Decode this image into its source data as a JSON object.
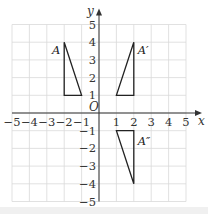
{
  "diagram": {
    "type": "coordinate-grid",
    "x_axis": {
      "label": "x",
      "min": -5,
      "max": 5,
      "ticks": [
        "−5",
        "−4",
        "−3",
        "−2",
        "−1",
        "1",
        "2",
        "3",
        "4",
        "5"
      ]
    },
    "y_axis": {
      "label": "y",
      "min": -5,
      "max": 5,
      "ticks": [
        "5",
        "4",
        "3",
        "2",
        "1",
        "−1",
        "−2",
        "−3",
        "−4",
        "−5"
      ]
    },
    "origin_label": "O",
    "shapes": [
      {
        "name": "A",
        "label": "A",
        "points": [
          [
            -2,
            4
          ],
          [
            -2,
            1
          ],
          [
            -1,
            1
          ]
        ]
      },
      {
        "name": "A-prime",
        "label": "A′",
        "points": [
          [
            2,
            4
          ],
          [
            2,
            1
          ],
          [
            1,
            1
          ]
        ]
      },
      {
        "name": "A-double-prime",
        "label": "A″",
        "points": [
          [
            1,
            -1
          ],
          [
            2,
            -1
          ],
          [
            2,
            -4
          ]
        ]
      }
    ]
  }
}
